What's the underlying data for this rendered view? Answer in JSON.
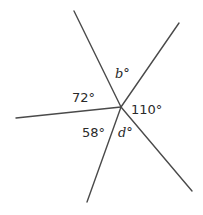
{
  "diagram": {
    "type": "angles-around-a-point",
    "center": {
      "x": 121,
      "y": 107
    },
    "rays": [
      {
        "name": "ray-upper-left",
        "x": 74,
        "y": 11
      },
      {
        "name": "ray-upper-right",
        "x": 179,
        "y": 23
      },
      {
        "name": "ray-left",
        "x": 16,
        "y": 118
      },
      {
        "name": "ray-lower-left",
        "x": 87,
        "y": 202
      },
      {
        "name": "ray-lower-right",
        "x": 192,
        "y": 191
      }
    ],
    "labels": {
      "b": "b°",
      "a72": "72°",
      "a110": "110°",
      "a58": "58°",
      "d": "d°"
    },
    "label_positions": {
      "b": {
        "x": 115,
        "y": 78
      },
      "a72": {
        "x": 72,
        "y": 102
      },
      "a110": {
        "x": 131,
        "y": 114
      },
      "a58": {
        "x": 82,
        "y": 137
      },
      "d": {
        "x": 118,
        "y": 137
      }
    },
    "line_color": "#4a4a4a",
    "text_color": "#2a2a2a"
  }
}
